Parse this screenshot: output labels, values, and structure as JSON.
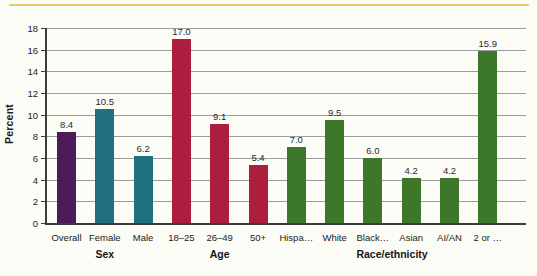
{
  "page": {
    "background_color": "#fcfcf7",
    "top_rule_color": "#e8ca62"
  },
  "chart_data": {
    "type": "bar",
    "title": "",
    "xlabel": "",
    "ylabel": "Percent",
    "ylim": [
      0,
      18
    ],
    "yticks": [
      0,
      2,
      4,
      6,
      8,
      10,
      12,
      14,
      16,
      18
    ],
    "grid": "horizontal",
    "gridline_color": "#9d9d9d",
    "axis_color": "#3c3c3c",
    "legend_position": "none",
    "categories": [
      "Overall",
      "Female",
      "Male",
      "18–25",
      "26–49",
      "50+",
      "Hispa…",
      "White",
      "Black…",
      "Asian",
      "AI/AN",
      "2 or …"
    ],
    "values": [
      8.4,
      10.5,
      6.2,
      17.0,
      9.1,
      5.4,
      7.0,
      9.5,
      6.0,
      4.2,
      4.2,
      15.9
    ],
    "value_labels": [
      "8.4",
      "10.5",
      "6.2",
      "17.0",
      "9.1",
      "5.4",
      "7.0",
      "9.5",
      "6.0",
      "4.2",
      "4.2",
      "15.9"
    ],
    "bar_colors": [
      "#4d1a5a",
      "#20707f",
      "#20707f",
      "#ac1e3d",
      "#ac1e3d",
      "#ac1e3d",
      "#3d772a",
      "#3d772a",
      "#3d772a",
      "#3d772a",
      "#3d772a",
      "#3d772a"
    ],
    "color_legend": {
      "sex_overall": "#4d1a5a",
      "sex": "#20707f",
      "age": "#ac1e3d",
      "race_ethnicity": "#3d772a"
    },
    "groups": [
      {
        "label": "Sex",
        "start": 0,
        "end": 2
      },
      {
        "label": "Age",
        "start": 3,
        "end": 5
      },
      {
        "label": "Race/ethnicity",
        "start": 6,
        "end": 11
      }
    ]
  }
}
